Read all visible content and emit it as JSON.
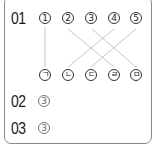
{
  "questions": [
    {
      "number": "01",
      "top_items": [
        "1",
        "2",
        "3",
        "4",
        "5"
      ],
      "bottom_items": [
        "ㄱ",
        "ㄴ",
        "ㄷ",
        "ㄹ",
        "ㅁ"
      ],
      "matches": [
        {
          "from": "1",
          "to": "ㄱ"
        },
        {
          "from": "2",
          "to": "ㄹ"
        },
        {
          "from": "3",
          "to": "ㅁ"
        },
        {
          "from": "4",
          "to": "ㄴ"
        },
        {
          "from": "5",
          "to": "ㄷ"
        }
      ]
    },
    {
      "number": "02",
      "answer": "3"
    },
    {
      "number": "03",
      "answer": "3"
    }
  ],
  "colors": {
    "frame": "#8a8a8a",
    "line": "#b5b5b5",
    "text": "#1a1a1a",
    "answer": "#666666"
  }
}
